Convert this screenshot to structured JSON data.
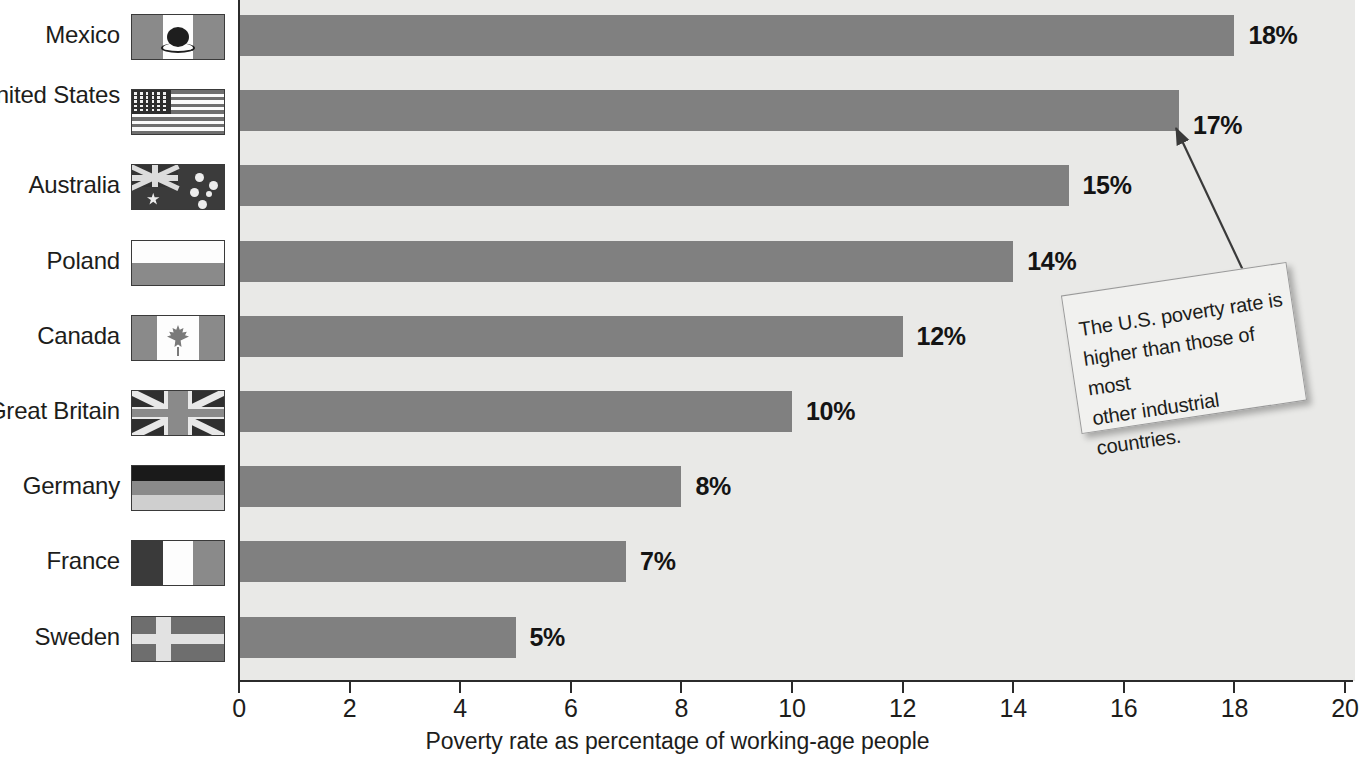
{
  "chart_data": {
    "type": "bar",
    "orientation": "horizontal",
    "title": "",
    "xlabel": "Poverty rate as percentage of working-age people",
    "ylabel": "",
    "xlim": [
      0,
      20
    ],
    "xticks": [
      0,
      2,
      4,
      6,
      8,
      10,
      12,
      14,
      16,
      18,
      20
    ],
    "grid": false,
    "legend": false,
    "categories": [
      "Mexico",
      "United States",
      "Australia",
      "Poland",
      "Canada",
      "Great Britain",
      "Germany",
      "France",
      "Sweden"
    ],
    "values": [
      18,
      17,
      15,
      14,
      12,
      10,
      8,
      7,
      5
    ],
    "value_labels": [
      "18%",
      "17%",
      "15%",
      "14%",
      "12%",
      "10%",
      "8%",
      "7%",
      "5%"
    ],
    "annotations": [
      {
        "text": "The U.S. poverty rate is higher than those of most other industrial countries.",
        "points_to": "United States"
      }
    ],
    "bar_color": "#808080",
    "plot_background": "#e9e9e7"
  },
  "axis": {
    "x_title": "Poverty rate as percentage of working-age people",
    "tick_labels": [
      "0",
      "2",
      "4",
      "6",
      "8",
      "10",
      "12",
      "14",
      "16",
      "18",
      "20"
    ]
  },
  "rows": [
    {
      "country": "Mexico",
      "value_label": "18%",
      "value": 18,
      "flag": "flag-mexico"
    },
    {
      "country": "United States",
      "value_label": "17%",
      "value": 17,
      "flag": "flag-united-states"
    },
    {
      "country": "Australia",
      "value_label": "15%",
      "value": 15,
      "flag": "flag-australia"
    },
    {
      "country": "Poland",
      "value_label": "14%",
      "value": 14,
      "flag": "flag-poland"
    },
    {
      "country": "Canada",
      "value_label": "12%",
      "value": 12,
      "flag": "flag-canada"
    },
    {
      "country": "Great Britain",
      "value_label": "10%",
      "value": 10,
      "flag": "flag-great-britain"
    },
    {
      "country": "Germany",
      "value_label": "8%",
      "value": 8,
      "flag": "flag-germany"
    },
    {
      "country": "France",
      "value_label": "7%",
      "value": 7,
      "flag": "flag-france"
    },
    {
      "country": "Sweden",
      "value_label": "5%",
      "value": 5,
      "flag": "flag-sweden"
    }
  ],
  "callout": {
    "line1": "The U.S. poverty rate is",
    "line2": "higher than those of most",
    "line3": "other industrial countries.",
    "full_text": "The U.S. poverty rate is higher than those of most other industrial countries."
  },
  "colors": {
    "bar": "#808080",
    "plot_bg": "#e9e9e7",
    "axis": "#2b2b2b",
    "text": "#1d1d1b",
    "callout_bg": "#f1f1ef"
  }
}
